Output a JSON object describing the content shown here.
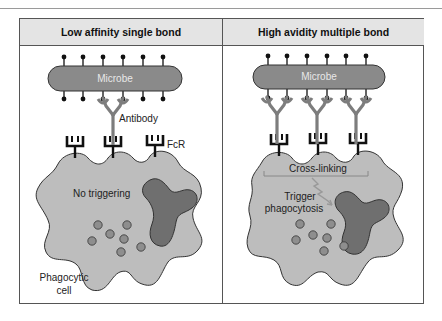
{
  "panels": [
    {
      "title": "Low affinity single bond",
      "microbe_label": "Microbe",
      "labels": {
        "antibody": "Antibody",
        "fcr": "FcR",
        "status": "No triggering",
        "cell_line1": "Phagocytic",
        "cell_line2": "cell"
      }
    },
    {
      "title": "High avidity multiple bond",
      "microbe_label": "Microbe",
      "labels": {
        "crosslink": "Cross-linking",
        "trigger_line1": "Trigger",
        "trigger_line2": "phagocytosis"
      }
    }
  ],
  "colors": {
    "header_fill": "#e4e4e4",
    "microbe_fill": "#8a8a8a",
    "antibody": "#7d7d7d",
    "receptor": "#111111",
    "cell_fill": "#bdbdbd",
    "nucleus_fill": "#6f6f6f",
    "granule_fill": "#8e8e8e"
  }
}
